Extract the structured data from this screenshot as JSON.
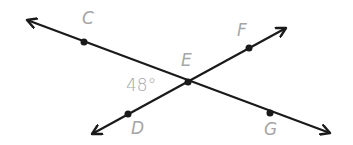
{
  "diagram": {
    "type": "intersecting-lines",
    "colors": {
      "line": "#1a1a1a",
      "label": "#a6a6a6",
      "background": "#ffffff"
    },
    "lines": [
      {
        "name": "line-CG",
        "from": [
          27,
          20
        ],
        "to": [
          330,
          133
        ],
        "arrows": "both",
        "points": [
          "C",
          "E",
          "G"
        ]
      },
      {
        "name": "line-DF",
        "from": [
          92,
          134
        ],
        "to": [
          286,
          28
        ],
        "arrows": "both",
        "points": [
          "D",
          "E",
          "F"
        ]
      }
    ],
    "points": [
      {
        "id": "C",
        "label": "C",
        "x": 84,
        "y": 42,
        "label_x": 82,
        "label_y": 10
      },
      {
        "id": "F",
        "label": "F",
        "x": 249,
        "y": 48,
        "label_x": 237,
        "label_y": 22
      },
      {
        "id": "E",
        "label": "E",
        "x": 188,
        "y": 82,
        "label_x": 181,
        "label_y": 52
      },
      {
        "id": "D",
        "label": "D",
        "x": 128,
        "y": 114,
        "label_x": 131,
        "label_y": 120
      },
      {
        "id": "G",
        "label": "G",
        "x": 270,
        "y": 113,
        "label_x": 264,
        "label_y": 121
      }
    ],
    "angle": {
      "label": "48°",
      "vertex": "E",
      "between": [
        "C",
        "D"
      ],
      "label_x": 126,
      "label_y": 77
    }
  }
}
